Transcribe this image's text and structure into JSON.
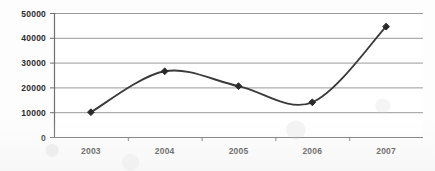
{
  "chart_data": {
    "type": "line",
    "title": "",
    "subtitle": "",
    "xlabel": "",
    "ylabel": "",
    "categories": [
      "2003",
      "2004",
      "2005",
      "2006",
      "2007"
    ],
    "values": [
      10000,
      26500,
      20500,
      14000,
      44500
    ],
    "series": [
      {
        "name": "",
        "values": [
          10000,
          26500,
          20500,
          14000,
          44500
        ]
      }
    ],
    "ylim": [
      0,
      50000
    ],
    "ytick_labels": [
      "0",
      "10000",
      "20000",
      "30000",
      "40000",
      "50000"
    ],
    "ytick_values": [
      0,
      10000,
      20000,
      30000,
      40000,
      50000
    ],
    "xtick_labels": [
      "2003",
      "2004",
      "2005",
      "2006",
      "2007"
    ],
    "grid": true,
    "grid_axis": "y",
    "legend": false,
    "legend_position": "none",
    "smoothing": "spline",
    "marker": "diamond",
    "annotations": []
  },
  "style": {
    "line_color": "#3a3a3a",
    "marker_color": "#2a2a2a",
    "grid_color": "#9a9a9a",
    "axis_color": "#6f6f6f",
    "text_color": "#2b2b2b",
    "background_color": "#fdfdfd"
  }
}
